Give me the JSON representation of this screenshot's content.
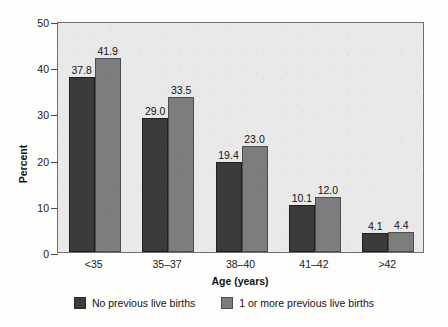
{
  "chart_data": {
    "type": "bar",
    "title": "",
    "xlabel": "Age (years)",
    "ylabel": "Percent",
    "categories": [
      "<35",
      "35–37",
      "38–40",
      "41–42",
      ">42"
    ],
    "series": [
      {
        "name": "No previous live births",
        "color": "#3b3b3b",
        "values": [
          37.8,
          29.0,
          19.4,
          10.1,
          4.1
        ]
      },
      {
        "name": "1 or more previous live births",
        "color": "#7d7d7d",
        "values": [
          41.9,
          33.5,
          23.0,
          12.0,
          4.4
        ]
      }
    ],
    "value_labels": [
      [
        "37.8",
        "41.9"
      ],
      [
        "29.0",
        "33.5"
      ],
      [
        "19.4",
        "23.0"
      ],
      [
        "10.1",
        "12.0"
      ],
      [
        "4.1",
        "4.4"
      ]
    ],
    "ylim": [
      0,
      50
    ],
    "yticks": [
      0,
      10,
      20,
      30,
      40,
      50
    ],
    "ytick_labels": [
      "0",
      "10",
      "20",
      "30",
      "40",
      "50"
    ],
    "grid": false,
    "legend_position": "bottom"
  },
  "legend": {
    "items": [
      {
        "label": "No previous live births",
        "swatch": "dark-swatch-icon"
      },
      {
        "label": "1 or more previous live births",
        "swatch": "gray-swatch-icon"
      }
    ]
  }
}
